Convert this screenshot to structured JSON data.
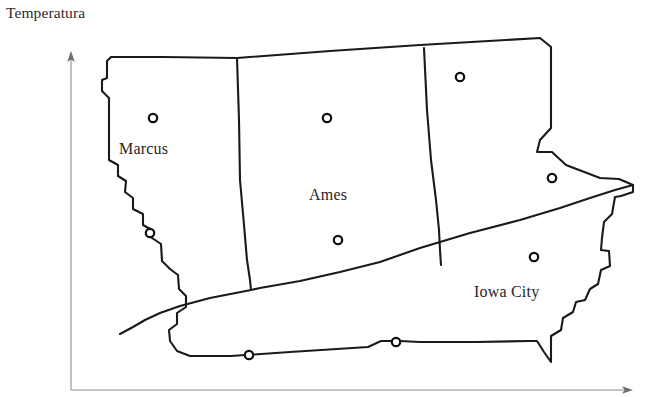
{
  "chart": {
    "title": "Temperatura",
    "type": "map",
    "axes": {
      "y_axis": {
        "x": 71,
        "y_top": 55,
        "y_bottom": 390,
        "arrow": "up"
      },
      "x_axis": {
        "y": 390,
        "x_left": 71,
        "x_right": 629,
        "arrow": "right"
      },
      "color": "#8c8c8c"
    },
    "map": {
      "region_name": "Iowa",
      "outline_color": "#1a1a1a",
      "fill_color": "#ffffff",
      "outline_points": "107,61 111,57 163,57 237,58 330,51 420,45 540,38 551,47 551,115 551,128 540,140 537,152 552,152 566,165 600,178 619,179 633,185 633,192 621,196 615,197 612,214 604,222 602,238 601,250 609,251 610,266 601,270 598,284 590,289 585,300 576,302 573,312 563,318 561,330 551,336 551,362 544,352 537,341 530,341 476,342 420,342 400,341 381,341 368,347 290,352 231,356 190,356 177,351 170,341 169,330 177,324 177,313 186,307 186,296 179,289 178,275 170,269 162,261 161,244 152,238 152,230 143,225 143,214 133,209 133,198 125,192 126,181 118,176 118,165 109,160 109,98 102,91 102,80 107,78",
      "internal_dividers": [
        "237,58 239,120 240,180 244,225 247,260 250,280 251,290",
        "424,48 427,110 431,160 436,200 439,230 440,250 441,265",
        "633,185 615,190 590,198 560,208 520,220 470,233 420,248 380,262 340,272 300,281 260,288 251,290 210,298 180,306 160,313 145,320 133,327 120,334"
      ]
    },
    "cities": [
      {
        "name": "Marcus",
        "marker_x": 153,
        "marker_y": 118,
        "label_x": 119,
        "label_y": 140,
        "labeled": true
      },
      {
        "name": "Ames",
        "marker_x": 338,
        "marker_y": 240,
        "label_x": 309,
        "label_y": 186,
        "labeled": true
      },
      {
        "name": "Iowa City",
        "marker_x": 534,
        "marker_y": 257,
        "label_x": 474,
        "label_y": 283,
        "labeled": true
      }
    ],
    "unlabeled_markers": [
      {
        "marker_x": 327,
        "marker_y": 118
      },
      {
        "marker_x": 460,
        "marker_y": 77
      },
      {
        "marker_x": 552,
        "marker_y": 178
      },
      {
        "marker_x": 150,
        "marker_y": 233
      },
      {
        "marker_x": 249,
        "marker_y": 355
      },
      {
        "marker_x": 396,
        "marker_y": 342
      }
    ],
    "marker_radius": 4.2
  }
}
